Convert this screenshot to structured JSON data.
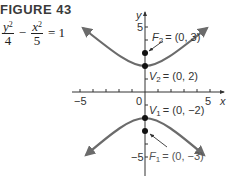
{
  "figure": {
    "title": "FIGURE 43",
    "equation": {
      "term1_num": "y",
      "term1_exp": "2",
      "term1_den": "4",
      "operator": "−",
      "term2_num": "x",
      "term2_exp": "2",
      "term2_den": "5",
      "rhs": "= 1"
    }
  },
  "axes": {
    "x_label": "x",
    "y_label": "y",
    "x_ticks": [
      "−5",
      "0",
      "5"
    ],
    "y_ticks": [
      "5",
      "−5"
    ],
    "x_range": [
      -5.5,
      5.5
    ],
    "y_range": [
      -6.5,
      6.5
    ]
  },
  "points": {
    "F2": {
      "label": "F",
      "sub": "2",
      "value": "= (0, 3)",
      "x": 0,
      "y": 3
    },
    "V2": {
      "label": "V",
      "sub": "2",
      "value": "= (0, 2)",
      "x": 0,
      "y": 2
    },
    "V1": {
      "label": "V",
      "sub": "1",
      "value": "= (0, −2)",
      "x": 0,
      "y": -2
    },
    "F1": {
      "label": "F",
      "sub": "1",
      "value": "= (0, −3)",
      "x": 0,
      "y": -3
    }
  },
  "colors": {
    "curve": "#6b6b6b",
    "axis": "#333333",
    "point": "#111111",
    "text": "#333333"
  }
}
